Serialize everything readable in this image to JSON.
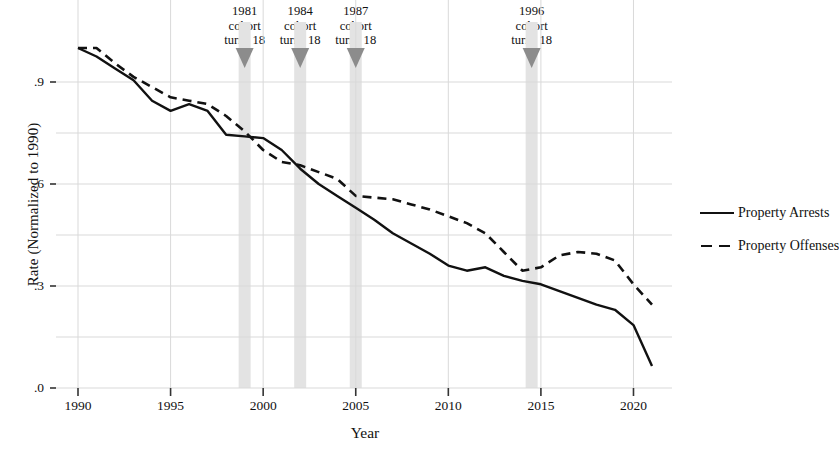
{
  "chart_data": {
    "type": "line",
    "title": "",
    "xlabel": "Year",
    "ylabel": "Rate (Normalized to 1990)",
    "xlim": [
      1990,
      2021
    ],
    "ylim": [
      0.0,
      1.05
    ],
    "grid": true,
    "legend_position": "right",
    "y_ticks": [
      ".9",
      ".6",
      ".3",
      ".0"
    ],
    "y_tick_values": [
      0.9,
      0.6,
      0.3,
      0.0
    ],
    "y_gridlines": [
      0.9,
      0.75,
      0.6,
      0.45,
      0.3,
      0.15,
      0.0
    ],
    "x_ticks": [
      "1990",
      "1995",
      "2000",
      "2005",
      "2010",
      "2015",
      "2020"
    ],
    "x_tick_values": [
      1990,
      1995,
      2000,
      2005,
      2010,
      2015,
      2020
    ],
    "x": [
      1990,
      1991,
      1992,
      1993,
      1994,
      1995,
      1996,
      1997,
      1998,
      1999,
      2000,
      2001,
      2002,
      2003,
      2004,
      2005,
      2006,
      2007,
      2008,
      2009,
      2010,
      2011,
      2012,
      2013,
      2014,
      2015,
      2016,
      2017,
      2018,
      2019,
      2020,
      2021
    ],
    "series": [
      {
        "name": "Property Arrests",
        "style": "solid",
        "color": "#111111",
        "values": [
          1.0,
          0.975,
          0.94,
          0.905,
          0.845,
          0.815,
          0.835,
          0.815,
          0.745,
          0.74,
          0.735,
          0.7,
          0.645,
          0.6,
          0.565,
          0.53,
          0.495,
          0.455,
          0.425,
          0.395,
          0.36,
          0.345,
          0.355,
          0.33,
          0.315,
          0.305,
          0.285,
          0.265,
          0.245,
          0.23,
          0.185,
          0.065
        ]
      },
      {
        "name": "Property Offenses",
        "style": "dashed",
        "color": "#111111",
        "values": [
          1.0,
          1.0,
          0.955,
          0.915,
          0.885,
          0.855,
          0.845,
          0.835,
          0.8,
          0.755,
          0.7,
          0.665,
          0.655,
          0.635,
          0.615,
          0.565,
          0.56,
          0.555,
          0.54,
          0.525,
          0.505,
          0.485,
          0.455,
          0.4,
          0.345,
          0.355,
          0.39,
          0.4,
          0.395,
          0.375,
          0.305,
          0.245
        ]
      }
    ],
    "annotations": [
      {
        "id": "cohort-1981",
        "line1": "1981",
        "line2": "cohort",
        "line3": "turns 18",
        "year": 1999
      },
      {
        "id": "cohort-1984",
        "line1": "1984",
        "line2": "cohort",
        "line3": "turns 18",
        "year": 2002
      },
      {
        "id": "cohort-1987",
        "line1": "1987",
        "line2": "cohort",
        "line3": "turns 18",
        "year": 2005
      },
      {
        "id": "cohort-1996",
        "line1": "1996",
        "line2": "cohort",
        "line3": "turns 18",
        "year": 2014.5
      }
    ],
    "band_color": "#e3e3e3",
    "grid_color": "#d9d9d9",
    "marker_color": "#8c8c8c"
  }
}
